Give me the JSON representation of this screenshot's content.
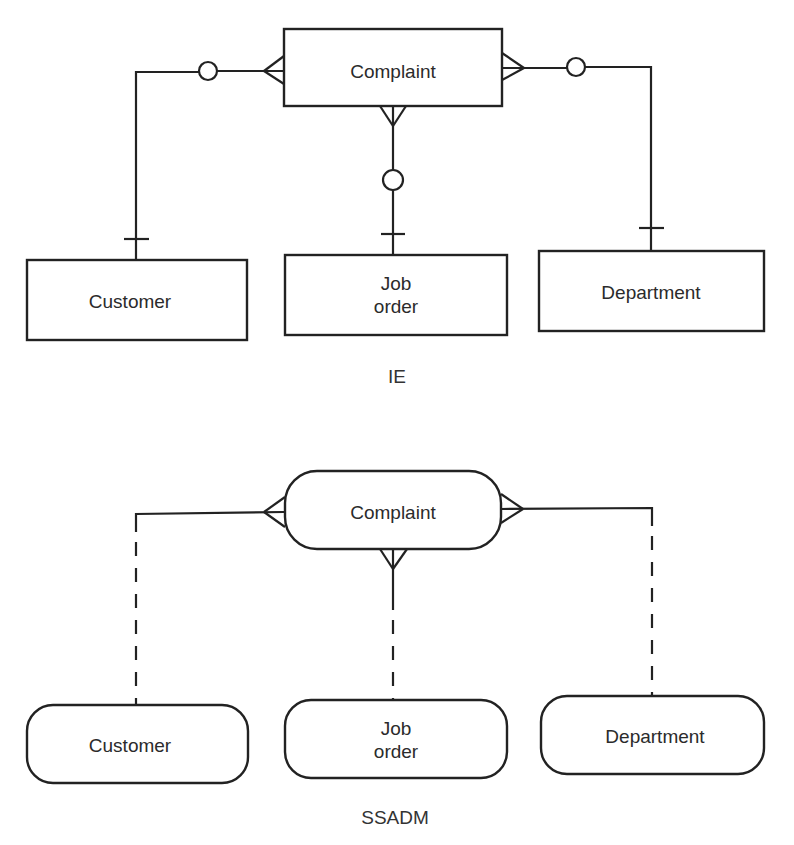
{
  "diagrams": {
    "ie": {
      "caption": "IE",
      "notation": "Information Engineering",
      "entities": {
        "complaint": "Complaint",
        "customer": "Customer",
        "job_order_line1": "Job",
        "job_order_line2": "order",
        "department": "Department"
      },
      "relationships": [
        {
          "from": "Customer",
          "to": "Complaint",
          "complaint_end": "crow's foot (many)",
          "customer_end": "circle (optional) + bar (one)"
        },
        {
          "from": "Job order",
          "to": "Complaint",
          "complaint_end": "crow's foot (many)",
          "job_order_end": "circle (optional) + bar (one)"
        },
        {
          "from": "Department",
          "to": "Complaint",
          "complaint_end": "crow's foot (many)",
          "department_end": "circle (optional) + bar (one)"
        }
      ]
    },
    "ssadm": {
      "caption": "SSADM",
      "notation": "SSADM",
      "entities": {
        "complaint": "Complaint",
        "customer": "Customer",
        "job_order_line1": "Job",
        "job_order_line2": "order",
        "department": "Department"
      },
      "relationships": [
        {
          "from": "Customer",
          "to": "Complaint",
          "complaint_end": "crow's foot (many)",
          "line": "solid near Complaint, dashed near Customer (optional)"
        },
        {
          "from": "Job order",
          "to": "Complaint",
          "complaint_end": "crow's foot (many)",
          "line": "solid near Complaint, dashed near Job order (optional)"
        },
        {
          "from": "Department",
          "to": "Complaint",
          "complaint_end": "crow's foot (many)",
          "line": "solid near Complaint, dashed near Department (optional)"
        }
      ]
    }
  }
}
